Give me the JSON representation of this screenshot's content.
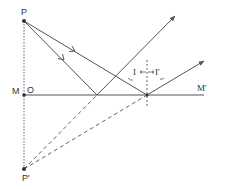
{
  "diagram": {
    "labels": {
      "P": "P",
      "P_image": "P'",
      "M": "M",
      "M_prime": "M'",
      "O": "O",
      "angle_incidence": "I",
      "angle_reflection": "I'"
    },
    "points": {
      "P": [
        24,
        21
      ],
      "O": [
        24,
        95
      ],
      "P_image": [
        24,
        169
      ],
      "reflect_1": [
        97,
        95
      ],
      "reflect_2": [
        147,
        95
      ]
    },
    "mirror": {
      "from": [
        24,
        95
      ],
      "to": [
        204,
        95
      ]
    },
    "rays": [
      {
        "name": "incident-ray-1",
        "from": [
          24,
          21
        ],
        "to": [
          97,
          95
        ],
        "style": "solid"
      },
      {
        "name": "reflected-ray-1",
        "from": [
          97,
          95
        ],
        "to": [
          175,
          16
        ],
        "style": "solid"
      },
      {
        "name": "incident-ray-2",
        "from": [
          24,
          21
        ],
        "to": [
          147,
          95
        ],
        "style": "solid"
      },
      {
        "name": "reflected-ray-2",
        "from": [
          147,
          95
        ],
        "to": [
          204,
          61
        ],
        "style": "solid"
      },
      {
        "name": "virtual-ray-1",
        "from": [
          24,
          169
        ],
        "to": [
          97,
          95
        ],
        "style": "dashed"
      },
      {
        "name": "virtual-ray-2",
        "from": [
          24,
          169
        ],
        "to": [
          147,
          95
        ],
        "style": "dashed"
      }
    ],
    "normal": {
      "x": 147,
      "y_from": 60,
      "y_to": 108,
      "style": "dashed"
    },
    "colors": {
      "line": "#555555",
      "text": "#333333",
      "background": "#ffffff"
    }
  }
}
